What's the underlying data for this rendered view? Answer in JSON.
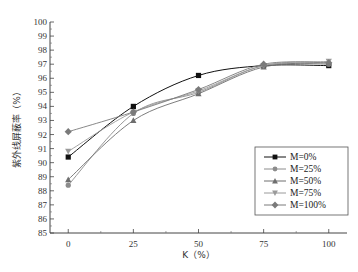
{
  "chart_data": {
    "type": "line",
    "title": "",
    "xlabel": "K（%）",
    "ylabel": "紫外线屏蔽率（%）",
    "x": [
      0,
      25,
      50,
      75,
      100
    ],
    "x_tick_labels": [
      "0",
      "25",
      "50",
      "75",
      "100"
    ],
    "xlim": [
      -7,
      107
    ],
    "ylim": [
      85,
      100
    ],
    "y_ticks": [
      85,
      86,
      87,
      88,
      89,
      90,
      91,
      92,
      93,
      94,
      95,
      96,
      97,
      98,
      99,
      100
    ],
    "grid": false,
    "legend_position": "right-middle",
    "series": [
      {
        "name": "M=0%",
        "marker": "square",
        "color": "#111111",
        "values": [
          90.4,
          94.0,
          96.2,
          96.9,
          96.9
        ]
      },
      {
        "name": "M=25%",
        "marker": "circle",
        "color": "#8c8c8c",
        "values": [
          88.4,
          93.5,
          95.0,
          96.9,
          97.0
        ]
      },
      {
        "name": "M=50%",
        "marker": "triangle-up",
        "color": "#6e6e6e",
        "values": [
          88.8,
          93.0,
          94.9,
          96.8,
          97.1
        ]
      },
      {
        "name": "M=75%",
        "marker": "triangle-down",
        "color": "#9a9a9a",
        "values": [
          90.8,
          93.6,
          95.1,
          96.9,
          97.2
        ]
      },
      {
        "name": "M=100%",
        "marker": "diamond",
        "color": "#7a7a7a",
        "values": [
          92.2,
          93.6,
          95.2,
          97.0,
          97.1
        ]
      }
    ]
  }
}
